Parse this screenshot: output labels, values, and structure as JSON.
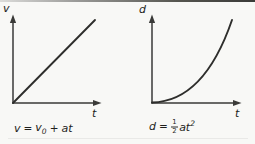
{
  "page": {
    "background_color": "#f8f8f6",
    "line_color": "#3a3a38",
    "curve_color": "#2e2e2c",
    "text_color": "#1f1f1d"
  },
  "graphs": [
    {
      "id": "velocity-time",
      "y_axis_label": "v",
      "x_axis_label": "t",
      "curve_type": "linear",
      "curve_description": "straight line rising from origin",
      "equation": {
        "lhs": "v",
        "equals": "=",
        "term1_base": "v",
        "term1_sub": "0",
        "operator": "+",
        "term2": "at"
      }
    },
    {
      "id": "distance-time",
      "y_axis_label": "d",
      "x_axis_label": "t",
      "curve_type": "quadratic",
      "curve_description": "parabolic curve rising from origin, concave up",
      "equation": {
        "lhs": "d",
        "equals": "=",
        "frac_numerator": "1",
        "frac_denominator": "2",
        "term_base": "at",
        "term_exponent": "2"
      }
    }
  ]
}
